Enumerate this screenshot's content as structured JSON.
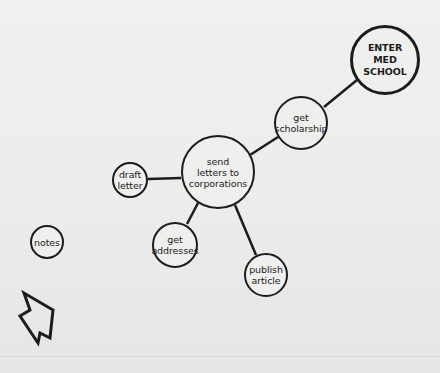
{
  "diagram": {
    "type": "goal-map",
    "nodes": [
      {
        "id": "goal",
        "label": "ENTER\nMED\nSCHOOL",
        "cx": 385,
        "cy": 60,
        "r": 35,
        "emphasis": "bold"
      },
      {
        "id": "scholarship",
        "label": "get\nscholarship",
        "cx": 301,
        "cy": 123,
        "r": 27
      },
      {
        "id": "send-letters",
        "label": "send\nletters to\ncorporations",
        "cx": 218,
        "cy": 172,
        "r": 37
      },
      {
        "id": "draft-letter",
        "label": "draft\nletter",
        "cx": 130,
        "cy": 180,
        "r": 18
      },
      {
        "id": "get-addresses",
        "label": "get\naddresses",
        "cx": 175,
        "cy": 245,
        "r": 23
      },
      {
        "id": "publish-article",
        "label": "publish\narticle",
        "cx": 266,
        "cy": 275,
        "r": 22
      },
      {
        "id": "notes",
        "label": "notes",
        "cx": 47,
        "cy": 242,
        "r": 17
      }
    ],
    "edges": [
      {
        "from": "goal",
        "to": "scholarship"
      },
      {
        "from": "scholarship",
        "to": "send-letters"
      },
      {
        "from": "send-letters",
        "to": "draft-letter"
      },
      {
        "from": "send-letters",
        "to": "get-addresses"
      },
      {
        "from": "send-letters",
        "to": "publish-article"
      }
    ],
    "pointer": {
      "icon": "arrow-cursor-icon"
    },
    "colors": {
      "stroke": "#1c1c1c",
      "paper": "#ededeb"
    }
  }
}
